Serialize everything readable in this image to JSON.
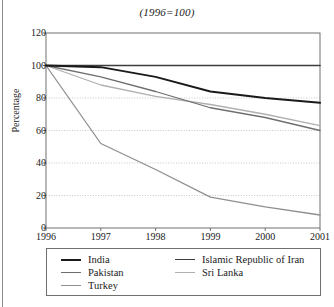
{
  "chart_data": {
    "type": "line",
    "title": "(1996=100)",
    "xlabel": "",
    "ylabel": "Percentage",
    "x": [
      "1996",
      "1997",
      "1998",
      "1999",
      "2000",
      "2001"
    ],
    "categories": [
      "1996",
      "1997",
      "1998",
      "1999",
      "2000",
      "2001"
    ],
    "xlim": [
      1996,
      2001
    ],
    "ylim": [
      0,
      120
    ],
    "yticks": [
      0,
      20,
      40,
      60,
      80,
      100,
      120
    ],
    "xticks": [
      "1996",
      "1997",
      "1998",
      "1999",
      "2000",
      "2001"
    ],
    "grid": "horizontal-dotted",
    "legend_position": "bottom",
    "series": [
      {
        "name": "India",
        "color": "#1a1a1a",
        "width": 2.0,
        "values": [
          100,
          99,
          93,
          84,
          80,
          77
        ]
      },
      {
        "name": "Pakistan",
        "color": "#6e6e6e",
        "width": 1.3,
        "values": [
          100,
          93,
          84,
          74,
          68,
          60
        ]
      },
      {
        "name": "Turkey",
        "color": "#8f8f8f",
        "width": 1.3,
        "values": [
          100,
          52,
          36,
          19,
          13,
          8
        ]
      },
      {
        "name": "Islamic Republic of Iran",
        "color": "#3c3c3c",
        "width": 1.6,
        "values": [
          100,
          100,
          100,
          100,
          100,
          100
        ]
      },
      {
        "name": "Sri Lanka",
        "color": "#b0b0b0",
        "width": 1.3,
        "values": [
          100,
          88,
          81,
          76,
          70,
          63
        ]
      }
    ]
  },
  "legend": {
    "columns": [
      [
        "India",
        "Pakistan",
        "Turkey"
      ],
      [
        "Islamic Republic of Iran",
        "Sri Lanka"
      ]
    ]
  }
}
